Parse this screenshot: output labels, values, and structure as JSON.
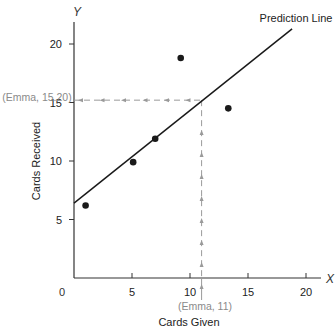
{
  "chart_data": {
    "type": "scatter",
    "title": "",
    "xlabel": "Cards Given",
    "ylabel": "Cards Received",
    "x_axis_letter": "X",
    "y_axis_letter": "Y",
    "xlim": [
      0,
      21
    ],
    "ylim": [
      0,
      22
    ],
    "xticks": [
      5,
      10,
      15,
      20
    ],
    "yticks": [
      5,
      10,
      15,
      20
    ],
    "origin_label": "0",
    "grid": false,
    "legend": null,
    "series": [
      {
        "name": "Observed",
        "points": [
          {
            "x": 1.0,
            "y": 6.2
          },
          {
            "x": 5.1,
            "y": 9.9
          },
          {
            "x": 7.0,
            "y": 11.9
          },
          {
            "x": 9.2,
            "y": 18.8
          },
          {
            "x": 13.3,
            "y": 14.5
          }
        ]
      }
    ],
    "prediction_line": {
      "label": "Prediction Line",
      "start": {
        "x": 0,
        "y": 6.4
      },
      "end": {
        "x": 18.8,
        "y": 21.3
      }
    },
    "annotations": [
      {
        "text": "(Emma, 15.20)",
        "target": "y",
        "value": 15.2
      },
      {
        "text": "(Emma, 11)",
        "target": "x",
        "value": 11
      }
    ]
  },
  "colors": {
    "axis": "#333333",
    "line": "#1a1a1a",
    "point": "#1a1a1a",
    "guide": "#9a9a9a",
    "annotation_text": "#8a8a8a",
    "text": "#222222"
  }
}
